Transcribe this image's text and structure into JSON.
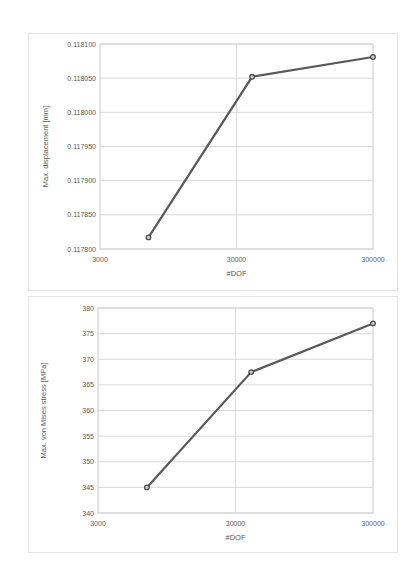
{
  "page": {
    "background": "#ffffff"
  },
  "chart_data": [
    {
      "type": "line",
      "title": "",
      "xlabel": "#DOF",
      "ylabel": "Max. displacement [mm]",
      "x_scale": "log",
      "x": [
        6800,
        39000,
        300000
      ],
      "values": [
        0.117817,
        0.118052,
        0.118081
      ],
      "xlim": [
        3000,
        300000
      ],
      "ylim": [
        0.1178,
        0.1181
      ],
      "x_ticks": [
        3000,
        30000,
        300000
      ],
      "x_tick_labels": [
        "3000",
        "30000",
        "300000"
      ],
      "y_ticks": [
        0.1178,
        0.11785,
        0.1179,
        0.11795,
        0.118,
        0.11805,
        0.1181
      ],
      "y_tick_labels": [
        "0.117800",
        "0.117850",
        "0.117900",
        "0.117950",
        "0.118000",
        "0.118050",
        "0.118100"
      ],
      "grid": true,
      "legend": "none",
      "line_color": "#595959",
      "marker": "circle",
      "marker_fill": "#cfcfcf",
      "marker_stroke": "#4a4a4a",
      "gridline_color": "#d9d9d9",
      "plot_border_color": "#c9c9c9",
      "tick_label_color": "#595959"
    },
    {
      "type": "line",
      "title": "",
      "xlabel": "#DOF",
      "ylabel": "Max. von Mises stress [MPa]",
      "x_scale": "log",
      "x": [
        6800,
        39000,
        300000
      ],
      "values": [
        345,
        367.5,
        377
      ],
      "xlim": [
        3000,
        300000
      ],
      "ylim": [
        340,
        380
      ],
      "x_ticks": [
        3000,
        30000,
        300000
      ],
      "x_tick_labels": [
        "3000",
        "30000",
        "300000"
      ],
      "y_ticks": [
        340,
        345,
        350,
        355,
        360,
        365,
        370,
        375,
        380
      ],
      "y_tick_labels": [
        "340",
        "345",
        "350",
        "355",
        "360",
        "365",
        "370",
        "375",
        "380"
      ],
      "grid": true,
      "legend": "none",
      "line_color": "#595959",
      "marker": "circle",
      "marker_fill": "#cfcfcf",
      "marker_stroke": "#4a4a4a",
      "gridline_color": "#d9d9d9",
      "plot_border_color": "#c9c9c9",
      "tick_label_color": "#595959"
    }
  ]
}
